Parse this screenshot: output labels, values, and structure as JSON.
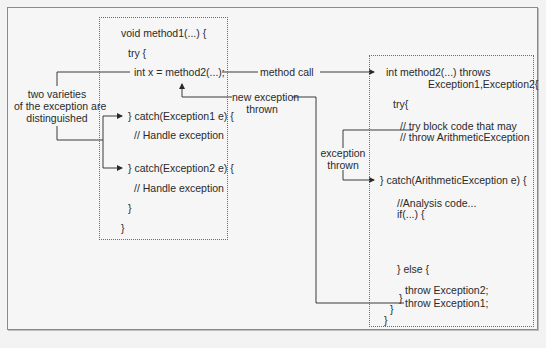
{
  "diagram": {
    "type": "exception-flow",
    "method1_box": {
      "lines": [
        "void method1(...) {",
        "try {",
        "int x = method2(...);",
        "} catch(Exception1 e) {",
        "// Handle exception",
        "} catch(Exception2 e) {",
        "// Handle exception",
        "}",
        "}"
      ]
    },
    "method2_box": {
      "lines": [
        "int method2(...)  throws",
        "Exception1,Exception2{",
        "try{",
        "// try block code that may",
        "// throw ArithmeticException",
        "} catch(ArithmeticException e) {",
        "//Analysis code...",
        "if(...) {",
        "throw Exception1;",
        "} else {",
        "throw Exception2;",
        "}",
        "}",
        "}"
      ]
    },
    "labels": {
      "two_varieties": [
        "two varieties",
        "of the exception are",
        "distinguished"
      ],
      "method_call": "method call",
      "new_exception": [
        "new exception",
        "thrown"
      ],
      "exception_thrown": [
        "exception",
        "thrown"
      ]
    },
    "colors": {
      "background": "#f6f6f6",
      "line": "#3a3a3a",
      "border": "#8a8a8a",
      "text": "#2a2a2a"
    }
  }
}
